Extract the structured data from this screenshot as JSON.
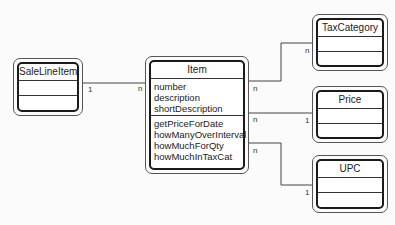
{
  "diagram": {
    "type": "UML class diagram",
    "classes": [
      {
        "id": "saleLineItem",
        "name": "SaleLineItem",
        "attributes": [],
        "operations": []
      },
      {
        "id": "item",
        "name": "Item",
        "attributes": [
          "number",
          "description",
          "shortDescription"
        ],
        "operations": [
          "getPriceForDate",
          "howManyOverInterval",
          "howMuchForQty",
          "howMuchInTaxCat"
        ]
      },
      {
        "id": "taxCategory",
        "name": "TaxCategory",
        "attributes": [],
        "operations": []
      },
      {
        "id": "price",
        "name": "Price",
        "attributes": [],
        "operations": []
      },
      {
        "id": "upc",
        "name": "UPC",
        "attributes": [],
        "operations": []
      }
    ],
    "associations": [
      {
        "from": "SaleLineItem",
        "to": "Item",
        "from_mult": "1",
        "to_mult": "n"
      },
      {
        "from": "Item",
        "to": "TaxCategory",
        "from_mult": "n",
        "to_mult": "n"
      },
      {
        "from": "Item",
        "to": "Price",
        "from_mult": "n",
        "to_mult": "1"
      },
      {
        "from": "Item",
        "to": "UPC",
        "from_mult": "n",
        "to_mult": "1"
      }
    ]
  }
}
